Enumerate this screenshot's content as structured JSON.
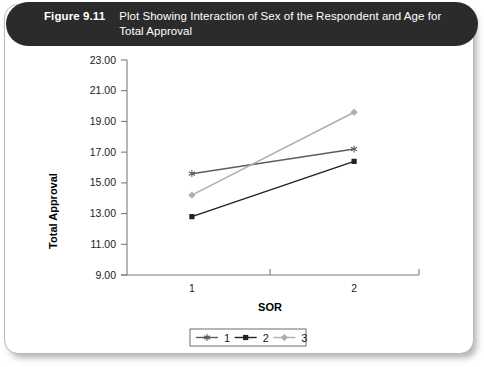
{
  "figure": {
    "number": "Figure 9.11",
    "caption": "Plot Showing Interaction of Sex of the Respondent and Age for Total Approval"
  },
  "chart_data": {
    "type": "line",
    "title": "Plot Showing Interaction of Sex of the Respondent and Age for Total Approval",
    "xlabel": "SOR",
    "ylabel": "Total Approval",
    "categories": [
      "1",
      "2"
    ],
    "x": [
      1,
      2
    ],
    "xlim": [
      0.6,
      2.4
    ],
    "ylim": [
      9.0,
      23.0
    ],
    "ytick_labels": [
      "9.00",
      "11.00",
      "13.00",
      "15.00",
      "17.00",
      "19.00",
      "21.00",
      "23.00"
    ],
    "ytick_values": [
      9.0,
      11.0,
      13.0,
      15.0,
      17.0,
      19.0,
      21.0,
      23.0
    ],
    "grid": false,
    "legend_position": "bottom",
    "series": [
      {
        "name": "1",
        "values": [
          15.6,
          17.2
        ],
        "color": "#5d5d5d",
        "marker": "star-marker"
      },
      {
        "name": "2",
        "values": [
          12.8,
          16.4
        ],
        "color": "#232323",
        "marker": "square-marker"
      },
      {
        "name": "3",
        "values": [
          14.2,
          19.6
        ],
        "color": "#aeaeae",
        "marker": "diamond-marker"
      }
    ]
  }
}
